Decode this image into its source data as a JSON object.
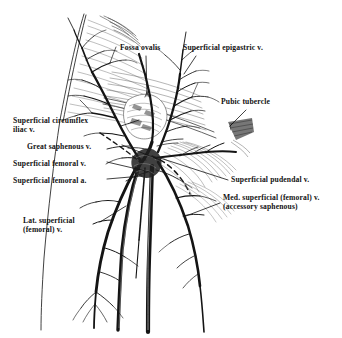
{
  "figure": {
    "background_color": "#ffffff",
    "ink_color": "#111111",
    "width": 342,
    "height": 338
  },
  "labels": [
    {
      "id": "fossa-ovalis",
      "text": "Fossa ovalis",
      "x": 120,
      "y": 47,
      "align": "left",
      "lines": 1
    },
    {
      "id": "superficial-epigastric-vein",
      "text": "Superficial epigastric v.",
      "x": 183,
      "y": 47,
      "align": "left",
      "lines": 1
    },
    {
      "id": "pubic-tubercle",
      "text": "Pubic tubercle",
      "x": 221,
      "y": 101,
      "align": "left",
      "lines": 1
    },
    {
      "id": "superficial-circumflex-iliac-vein",
      "text": "Superficial circumflex\niliac v.",
      "x": 13,
      "y": 120,
      "align": "left",
      "lines": 2
    },
    {
      "id": "great-saphenous-vein",
      "text": "Great saphenous v.",
      "x": 27,
      "y": 146,
      "align": "left",
      "lines": 1
    },
    {
      "id": "superficial-femoral-vein",
      "text": "Superficial femoral v.",
      "x": 13,
      "y": 163,
      "align": "left",
      "lines": 1
    },
    {
      "id": "superficial-femoral-artery",
      "text": "Superficial femoral a.",
      "x": 13,
      "y": 180,
      "align": "left",
      "lines": 1
    },
    {
      "id": "superficial-pudendal-vein",
      "text": "Superficial pudendal v.",
      "x": 231,
      "y": 179,
      "align": "left",
      "lines": 1
    },
    {
      "id": "medial-superficial-femoral-vein",
      "text": "Med. superficial (femoral) v.\n(accessory saphenous)",
      "x": 223,
      "y": 197,
      "align": "left",
      "lines": 2
    },
    {
      "id": "lateral-superficial-femoral-vein",
      "text": "Lat. superficial\n(femoral) v.",
      "x": 23,
      "y": 220,
      "align": "left",
      "lines": 2
    }
  ],
  "structures": [
    {
      "id": "fossa-ovalis",
      "kind": "opening",
      "note": "saphenous opening in fascia lata"
    },
    {
      "id": "superficial-epigastric-vein",
      "kind": "vein"
    },
    {
      "id": "pubic-tubercle",
      "kind": "bony-landmark"
    },
    {
      "id": "superficial-circumflex-iliac-vein",
      "kind": "vein"
    },
    {
      "id": "great-saphenous-vein",
      "kind": "vein"
    },
    {
      "id": "superficial-femoral-vein",
      "kind": "vein"
    },
    {
      "id": "superficial-femoral-artery",
      "kind": "artery"
    },
    {
      "id": "superficial-pudendal-vein",
      "kind": "vein"
    },
    {
      "id": "medial-superficial-femoral-vein",
      "kind": "vein"
    },
    {
      "id": "lateral-superficial-femoral-vein",
      "kind": "vein"
    }
  ]
}
